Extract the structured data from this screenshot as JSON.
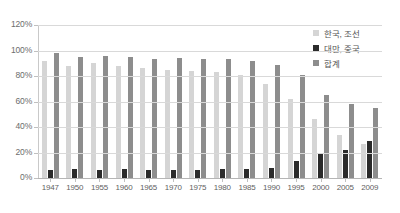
{
  "chart_data": {
    "type": "bar",
    "title": "",
    "subtitle": "",
    "xlabel": "",
    "ylabel": "",
    "ylim": [
      0,
      120
    ],
    "ytick_labels": [
      "120%",
      "100%",
      "80%",
      "60%",
      "40%",
      "20%",
      "0%"
    ],
    "ytick_values": [
      120,
      100,
      80,
      60,
      40,
      20,
      0
    ],
    "grid": true,
    "legend_position": "top-right",
    "categories": [
      "1947",
      "1950",
      "1955",
      "1960",
      "1965",
      "1970",
      "1975",
      "1980",
      "1985",
      "1990",
      "1995",
      "2000",
      "2005",
      "2009"
    ],
    "series": [
      {
        "name": "한국, 조선",
        "color": "#d5d5d5",
        "values": [
          92,
          88,
          90,
          88,
          86,
          85,
          84,
          83,
          81,
          74,
          62,
          46,
          34,
          27
        ]
      },
      {
        "name": "대만, 중국",
        "color": "#2b2b2b",
        "values": [
          6,
          7,
          6,
          7,
          6,
          6,
          6,
          7,
          7,
          8,
          13,
          19,
          22,
          29
        ]
      },
      {
        "name": "합계",
        "color": "#8d8d8d",
        "values": [
          98,
          95,
          96,
          95,
          93,
          94,
          93,
          93,
          92,
          89,
          81,
          65,
          58,
          55
        ]
      }
    ]
  },
  "legend": {
    "items": [
      {
        "label": "한국, 조선",
        "color": "#d5d5d5"
      },
      {
        "label": "대만, 중국",
        "color": "#2b2b2b"
      },
      {
        "label": "합계",
        "color": "#8d8d8d"
      }
    ]
  }
}
